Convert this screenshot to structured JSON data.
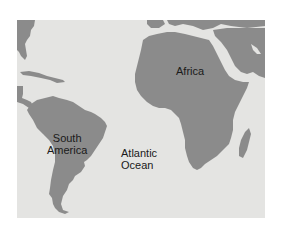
{
  "map": {
    "background_color": "#e4e4e2",
    "land_color": "#8b8b8b",
    "labels": {
      "south_america": [
        "South",
        "America"
      ],
      "atlantic_ocean": [
        "Atlantic",
        "Ocean"
      ],
      "africa": "Africa"
    }
  }
}
